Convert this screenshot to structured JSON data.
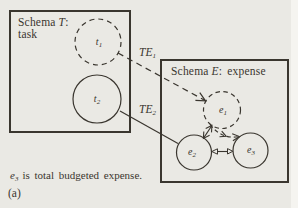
{
  "colors": {
    "paper": "#eae9e4",
    "ink": "#3a362f"
  },
  "task_schema": {
    "title_word": "Schema",
    "title_symbol": "T",
    "title_colon": ":",
    "subtitle": "task"
  },
  "expense_schema": {
    "title_word": "Schema",
    "title_symbol": "E",
    "title_colon": ":",
    "title_name": "expense"
  },
  "nodes": {
    "t1": {
      "letter": "t",
      "sub": "1",
      "outline": "dashed"
    },
    "t2": {
      "letter": "t",
      "sub": "2",
      "outline": "solid"
    },
    "e1": {
      "letter": "e",
      "sub": "1",
      "outline": "dashed"
    },
    "e2": {
      "letter": "e",
      "sub": "2",
      "outline": "solid"
    },
    "e3": {
      "letter": "e",
      "sub": "3",
      "outline": "solid"
    }
  },
  "links": {
    "te1": {
      "letters": "TE",
      "sub": "1",
      "style": "dashed",
      "from": "t1",
      "to": "e1"
    },
    "te2": {
      "letters": "TE",
      "sub": "2",
      "style": "solid",
      "from": "t2",
      "to": "e2"
    }
  },
  "caption": {
    "letter": "e",
    "sub": "3",
    "text": "is total budgeted expense."
  },
  "figure_label": "(a)"
}
